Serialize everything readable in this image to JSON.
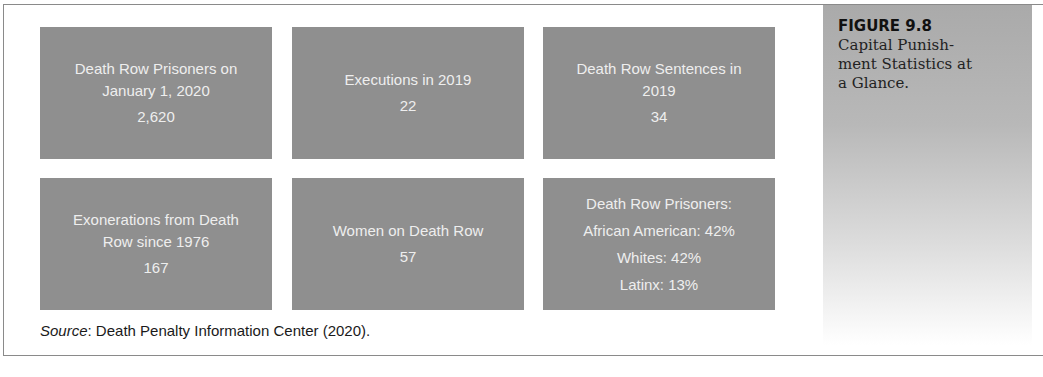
{
  "figure": {
    "label": "FIGURE 9.8",
    "title_lines": [
      "Capital Punish-",
      "ment Statistics at",
      "a Glance."
    ]
  },
  "stats": [
    {
      "label_lines": [
        "Death Row Prisoners on",
        "January 1, 2020"
      ],
      "value": "2,620"
    },
    {
      "label_lines": [
        "Executions in 2019"
      ],
      "value": "22"
    },
    {
      "label_lines": [
        "Death Row Sentences in",
        "2019"
      ],
      "value": "34"
    },
    {
      "label_lines": [
        "Exonerations from Death",
        "Row since 1976"
      ],
      "value": "167"
    },
    {
      "label_lines": [
        "Women on Death Row"
      ],
      "value": "57"
    },
    {
      "label_lines": [
        "Death Row Prisoners:"
      ],
      "breakdown": [
        "African American: 42%",
        "Whites: 42%",
        "Latinx: 13%"
      ]
    }
  ],
  "source": {
    "prefix": "Source",
    "text": ": Death Penalty Information Center (2020)."
  },
  "colors": {
    "box_background": "#8f8f8f",
    "box_text": "#eeeeee",
    "border": "#8a8a8a"
  }
}
